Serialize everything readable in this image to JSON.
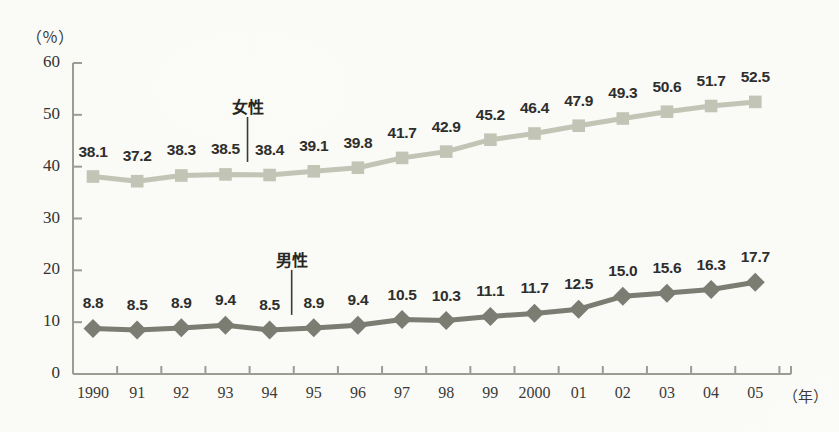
{
  "chart_data": {
    "type": "line",
    "title": "",
    "subtitle": "",
    "xlabel": "年",
    "ylabel": "（％）",
    "ylim": [
      0,
      60
    ],
    "yticks": [
      0,
      10,
      20,
      30,
      40,
      50,
      60
    ],
    "grid": false,
    "legend_position": "inline-annotation",
    "x": [
      1990,
      1991,
      1992,
      1993,
      1994,
      1995,
      1996,
      1997,
      1998,
      1999,
      2000,
      2001,
      2002,
      2003,
      2004,
      2005
    ],
    "categories": [
      "1990",
      "91",
      "92",
      "93",
      "94",
      "95",
      "96",
      "97",
      "98",
      "99",
      "2000",
      "01",
      "02",
      "03",
      "04",
      "05"
    ],
    "series": [
      {
        "name": "女性",
        "name_en": "female",
        "marker": "square",
        "color": "#c2c5b6",
        "values": [
          38.1,
          37.2,
          38.3,
          38.5,
          38.4,
          39.1,
          39.8,
          41.7,
          42.9,
          45.2,
          46.4,
          47.9,
          49.3,
          50.6,
          51.7,
          52.5
        ],
        "labels": [
          "38.1",
          "37.2",
          "38.3",
          "38.5",
          "38.4",
          "39.1",
          "39.8",
          "41.7",
          "42.9",
          "45.2",
          "46.4",
          "47.9",
          "49.3",
          "50.6",
          "51.7",
          "52.5"
        ],
        "annotation": {
          "text": "女性",
          "at_index": 4
        }
      },
      {
        "name": "男性",
        "name_en": "male",
        "marker": "diamond",
        "color": "#7b7c72",
        "values": [
          8.8,
          8.5,
          8.9,
          9.4,
          8.5,
          8.9,
          9.4,
          10.5,
          10.3,
          11.1,
          11.7,
          12.5,
          15.0,
          15.6,
          16.3,
          17.7
        ],
        "labels": [
          "8.8",
          "8.5",
          "8.9",
          "9.4",
          "8.5",
          "8.9",
          "9.4",
          "10.5",
          "10.3",
          "11.1",
          "11.7",
          "12.5",
          "15.0",
          "15.6",
          "16.3",
          "17.7"
        ],
        "annotation": {
          "text": "男性",
          "at_index": 5
        }
      }
    ],
    "axis_color": "#9c9c92",
    "text_color": "#2e2e2c",
    "background": "#fbfbf9"
  }
}
